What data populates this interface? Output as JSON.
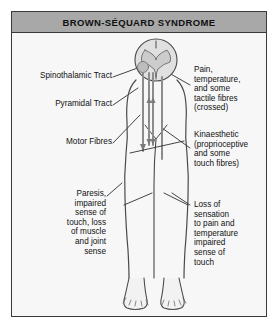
{
  "title": "BROWN-SÉQUARD SYNDROME",
  "colors": {
    "title_band": "#a8a8a8",
    "frame_border": "#3a3a3a",
    "page_background": "#ffffff",
    "panel_background": "#f7f7f7",
    "ink": "#111111",
    "anatomy_outline": "#4a4a4a",
    "tract_line": "#8c8c8c",
    "grey_matter": "#cccccc"
  },
  "labels": {
    "left": [
      {
        "id": "spinothalamic-tract",
        "text": "Spinothalamic Tract"
      },
      {
        "id": "pyramidal-tract",
        "text": "Pyramidal Tract"
      },
      {
        "id": "motor-fibres",
        "text": "Motor Fibres"
      },
      {
        "id": "paresis",
        "text": "Paresis,\nimpaired\nsense of\ntouch, loss\nof muscle\nand joint\nsense"
      }
    ],
    "right": [
      {
        "id": "pain-temperature",
        "text": "Pain,\ntemperature,\nand some\ntactile fibres\n(crossed)"
      },
      {
        "id": "kinaesthetic",
        "text": "Kinaesthetic\n(proprioceptive\nand some\ntouch fibres)"
      },
      {
        "id": "loss-of-sensation",
        "text": "Loss of\nsensation\nto pain and\ntemperature\nimpaired\nsense of\ntouch"
      }
    ]
  },
  "figure": {
    "name": "human-body-with-spinal-cord-cross-section",
    "parts": [
      "spinal-cord-cross-section",
      "grey-matter-butterfly",
      "torso-outline",
      "left-leg",
      "right-leg",
      "left-foot",
      "right-foot",
      "descending-tract-arrow",
      "ascending-tract-lines"
    ]
  }
}
